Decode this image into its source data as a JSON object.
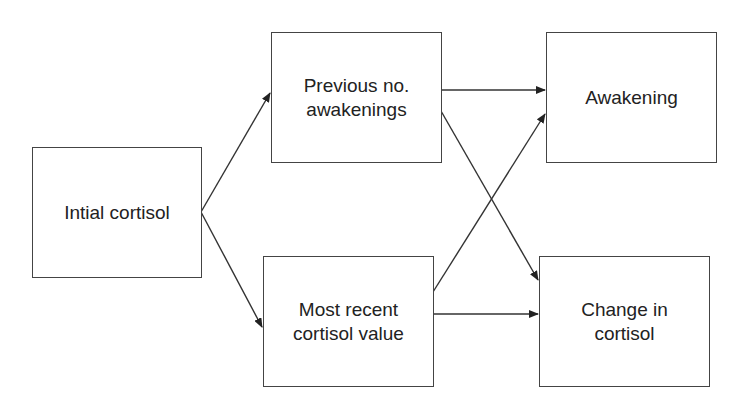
{
  "diagram": {
    "type": "flow",
    "nodes": [
      {
        "id": "initial",
        "label": "Intial cortisol"
      },
      {
        "id": "prev",
        "label": "Previous no.\nawakenings"
      },
      {
        "id": "recent",
        "label": "Most recent\ncortisol value"
      },
      {
        "id": "awakening",
        "label": "Awakening"
      },
      {
        "id": "change",
        "label": "Change in\ncortisol"
      }
    ],
    "edges": [
      {
        "from": "initial",
        "to": "prev"
      },
      {
        "from": "initial",
        "to": "recent"
      },
      {
        "from": "prev",
        "to": "awakening"
      },
      {
        "from": "prev",
        "to": "change"
      },
      {
        "from": "recent",
        "to": "awakening"
      },
      {
        "from": "recent",
        "to": "change"
      }
    ],
    "colors": {
      "stroke": "#333333",
      "background": "#ffffff"
    }
  }
}
